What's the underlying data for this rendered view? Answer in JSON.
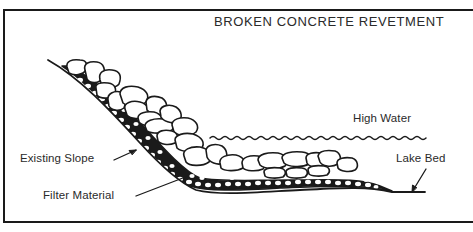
{
  "diagram": {
    "title": "BROKEN CONCRETE REVETMENT",
    "labels": {
      "high_water": "High Water",
      "existing_slope": "Existing Slope",
      "filter_material": "Filter Material",
      "lake_bed": "Lake Bed"
    },
    "colors": {
      "ink": "#1a1a1a",
      "background": "#ffffff"
    }
  }
}
